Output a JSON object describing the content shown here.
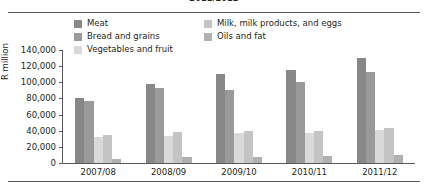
{
  "title_sliver": "2011/2012",
  "legend": {
    "columns": [
      {
        "items": [
          {
            "label": "Meat",
            "color": "#878787"
          },
          {
            "label": "Bread and grains",
            "color": "#9a9a9a"
          },
          {
            "label": "Vegetables and fruit",
            "color": "#d9d9d9"
          }
        ]
      },
      {
        "items": [
          {
            "label": "Milk, milk products, and eggs",
            "color": "#c4c4c4"
          },
          {
            "label": "Oils and fat",
            "color": "#b0b0b0"
          }
        ]
      }
    ]
  },
  "chart_data": {
    "type": "bar",
    "title": "",
    "xlabel": "",
    "ylabel": "R million",
    "ylim": [
      0,
      140000
    ],
    "ytick_labels": [
      "140,000",
      "120,000",
      "100,000",
      "80,000",
      "60,000",
      "40,000",
      "20,000",
      "0"
    ],
    "ytick_values": [
      140000,
      120000,
      100000,
      80000,
      60000,
      40000,
      20000,
      0
    ],
    "grid": false,
    "legend_position": "top",
    "categories": [
      "2007/08",
      "2008/09",
      "2009/10",
      "2010/11",
      "2011/12"
    ],
    "series": [
      {
        "name": "Meat",
        "color": "#878787",
        "values": [
          80000,
          98000,
          110000,
          115000,
          130000
        ]
      },
      {
        "name": "Bread and grains",
        "color": "#9a9a9a",
        "values": [
          77000,
          93000,
          90000,
          100000,
          113000
        ]
      },
      {
        "name": "Vegetables and fruit",
        "color": "#d9d9d9",
        "values": [
          32000,
          34000,
          37000,
          37000,
          41000
        ]
      },
      {
        "name": "Milk, milk products, and eggs",
        "color": "#c4c4c4",
        "values": [
          35000,
          39000,
          40000,
          40000,
          44000
        ]
      },
      {
        "name": "Oils and fat",
        "color": "#b0b0b0",
        "values": [
          5000,
          7000,
          8000,
          9000,
          10000
        ]
      }
    ]
  }
}
